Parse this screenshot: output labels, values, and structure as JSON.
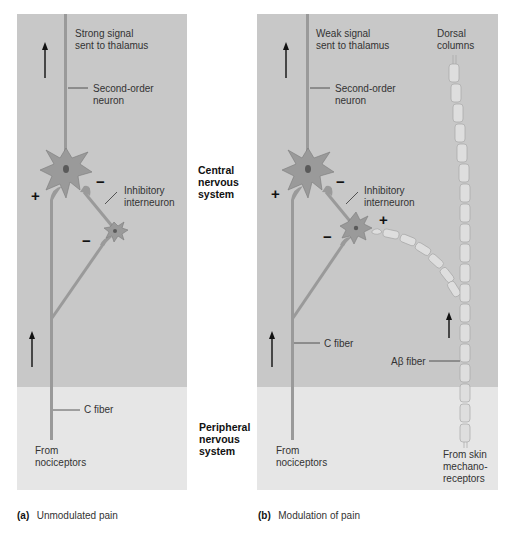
{
  "regions": {
    "central": [
      "Central",
      "nervous",
      "system"
    ],
    "peripheral": [
      "Peripheral",
      "nervous",
      "system"
    ]
  },
  "panel_a": {
    "caption_letter": "(a)",
    "caption_text": "Unmodulated pain",
    "signal_label": [
      "Strong signal",
      "sent to thalamus"
    ],
    "second_order_label": [
      "Second-order",
      "neuron"
    ],
    "interneuron_label": [
      "Inhibitory",
      "interneuron"
    ],
    "c_fiber_label": "C fiber",
    "source_label": [
      "From",
      "nociceptors"
    ],
    "signs": {
      "excite": "+",
      "inhibit_1": "−",
      "inhibit_2": "−"
    }
  },
  "panel_b": {
    "caption_letter": "(b)",
    "caption_text": "Modulation of pain",
    "signal_label": [
      "Weak signal",
      "sent to thalamus"
    ],
    "dorsal_label": [
      "Dorsal",
      "columns"
    ],
    "second_order_label": [
      "Second-order",
      "neuron"
    ],
    "interneuron_label": [
      "Inhibitory",
      "interneuron"
    ],
    "c_fiber_label": "C fiber",
    "abeta_label": "Aβ fiber",
    "source_label": [
      "From",
      "nociceptors"
    ],
    "mech_label": [
      "From skin",
      "mechano-",
      "receptors"
    ],
    "signs": {
      "excite": "+",
      "inhibit_1": "−",
      "inhibit_2": "−",
      "excite_2": "+"
    }
  },
  "colors": {
    "cns_bg": "#c8c8c8",
    "pns_bg": "#e6e6e6",
    "neuron": "#9a9a9a",
    "neuron_edge": "#7a7a7a",
    "nucleus": "#5a5a5a",
    "myelin": "#dedede"
  }
}
